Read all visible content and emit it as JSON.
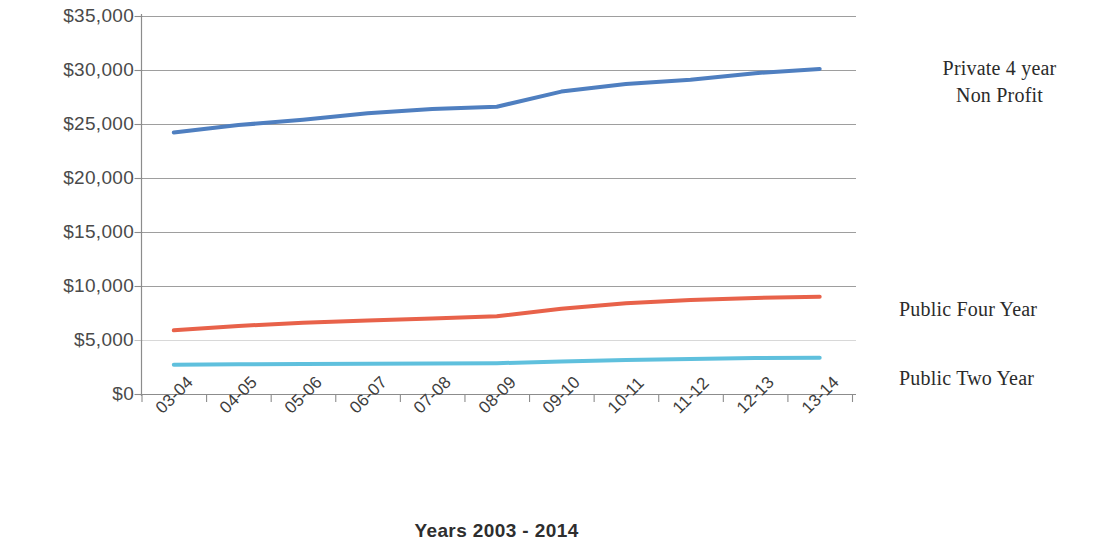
{
  "chart_data": {
    "type": "line",
    "title": "",
    "xlabel": "Years 2003 - 2014",
    "ylabel": "",
    "categories": [
      "03-04",
      "04-05",
      "05-06",
      "06-07",
      "07-08",
      "08-09",
      "09-10",
      "10-11",
      "11-12",
      "12-13",
      "13-14"
    ],
    "ylim": [
      0,
      35000
    ],
    "ytick_values": [
      0,
      5000,
      10000,
      15000,
      20000,
      25000,
      30000,
      35000
    ],
    "ytick_labels": [
      "$0",
      "$5,000",
      "$10,000",
      "$15,000",
      "$20,000",
      "$25,000",
      "$30,000",
      "$35,000"
    ],
    "grid": "horizontal",
    "legend_position": "right-inline",
    "series": [
      {
        "name": "Private 4 year Non Profit",
        "color": "#4f7fc0",
        "values": [
          24200,
          24900,
          25400,
          26000,
          26400,
          26600,
          28000,
          28700,
          29100,
          29700,
          30100
        ]
      },
      {
        "name": "Public Four Year",
        "color": "#e8624a",
        "values": [
          5900,
          6300,
          6600,
          6800,
          7000,
          7200,
          7900,
          8400,
          8700,
          8900,
          9000
        ]
      },
      {
        "name": "Public Two Year",
        "color": "#5fc0dd",
        "values": [
          2700,
          2750,
          2780,
          2800,
          2820,
          2850,
          3000,
          3150,
          3250,
          3320,
          3350
        ]
      }
    ]
  },
  "axis": {
    "x_title": "Years 2003 - 2014"
  },
  "series_labels": {
    "private_line1": "Private 4 year",
    "private_line2": "Non Profit",
    "public_four": "Public Four Year",
    "public_two": "Public Two Year"
  }
}
